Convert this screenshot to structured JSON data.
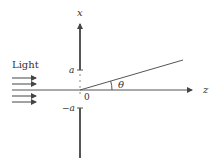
{
  "diagram": {
    "type": "slit-diffraction-geometry",
    "labels": {
      "light": "Light",
      "x_axis": "x",
      "z_axis": "z",
      "top_edge": "a",
      "bottom_edge": "−a",
      "origin": "0",
      "angle": "θ"
    },
    "elements": [
      {
        "id": "light-arrows",
        "kind": "arrows",
        "count": 4,
        "direction": "right"
      },
      {
        "id": "x-axis",
        "kind": "axis",
        "orientation": "vertical",
        "label": "x"
      },
      {
        "id": "z-axis",
        "kind": "axis",
        "orientation": "horizontal",
        "label": "z"
      },
      {
        "id": "aperture",
        "kind": "gap",
        "from": "-a",
        "to": "a"
      },
      {
        "id": "diffracted-ray",
        "kind": "ray",
        "angle_label": "θ"
      }
    ],
    "colors": {
      "line": "#555555",
      "text": "#333333"
    }
  }
}
